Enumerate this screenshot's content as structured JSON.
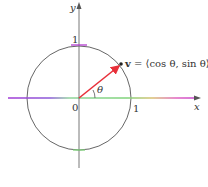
{
  "diagram": {
    "axes": {
      "x_label": "x",
      "y_label": "y"
    },
    "ticks": {
      "origin": "0",
      "x_one": "1",
      "y_one": "1"
    },
    "angle_label": "θ",
    "vector": {
      "name": "v",
      "expression": " = ⟨cos θ, sin θ⟩",
      "color": "#e8303a"
    },
    "colors": {
      "circle": "#555555",
      "axis": "#555555",
      "x_axis_left": "#a23bd6",
      "x_axis_mid": "#7fd37a",
      "x_axis_right": "#e040c8",
      "y_tick_top": "#b23bd0",
      "y_tick_bottom": "#7fd37a"
    }
  }
}
